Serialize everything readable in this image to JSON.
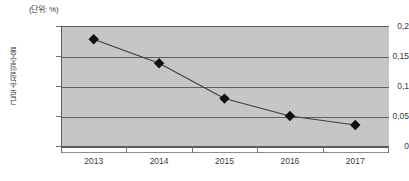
{
  "caption": {
    "unit_note": "(단위: %)"
  },
  "axis": {
    "y_title": "근로손실일수율",
    "y_ticks": [
      "0,2",
      "0,15",
      "0,1",
      "0,05",
      "0"
    ],
    "x_ticks": [
      "2013",
      "2014",
      "2015",
      "2016",
      "2017"
    ]
  },
  "colors": {
    "plot_background": "#c6c6c6",
    "gridline": "#5c5c5c",
    "axis": "#5a5a5a",
    "series_line": "#3d3d3d",
    "marker": "#111111",
    "text": "#3a3a3a"
  },
  "chart_data": {
    "type": "line",
    "title": "",
    "subtitle": "",
    "xlabel": "",
    "ylabel": "근로손실일수율",
    "unit": "%",
    "categories": [
      "2013",
      "2014",
      "2015",
      "2016",
      "2017"
    ],
    "values": [
      0.178,
      0.138,
      0.079,
      0.05,
      0.035
    ],
    "series": [
      {
        "name": "근로손실일수율",
        "values": [
          0.178,
          0.138,
          0.079,
          0.05,
          0.035
        ]
      }
    ],
    "ylim": [
      0,
      0.2
    ],
    "y_tick_values": [
      0.2,
      0.15,
      0.1,
      0.05,
      0
    ],
    "grid": true,
    "legend": false,
    "marker": "diamond"
  }
}
